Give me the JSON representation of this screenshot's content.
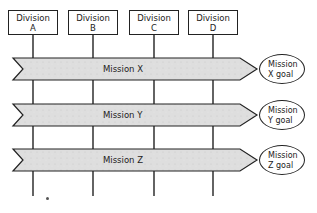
{
  "diagram": {
    "type": "matrix-organization",
    "colors": {
      "line": "#222222",
      "arrow_fill": "#dcdcdc",
      "background": "#ffffff"
    },
    "divisions": [
      {
        "label": "Division",
        "letter": "A"
      },
      {
        "label": "Division",
        "letter": "B"
      },
      {
        "label": "Division",
        "letter": "C"
      },
      {
        "label": "Division",
        "letter": "D"
      }
    ],
    "missions": [
      {
        "label": "Mission  X",
        "goal_line1": "Mission",
        "goal_line2": "X goal"
      },
      {
        "label": "Mission  Y",
        "goal_line1": "Mission",
        "goal_line2": "Y goal"
      },
      {
        "label": "Mission  Z",
        "goal_line1": "Mission",
        "goal_line2": "Z goal"
      }
    ]
  }
}
